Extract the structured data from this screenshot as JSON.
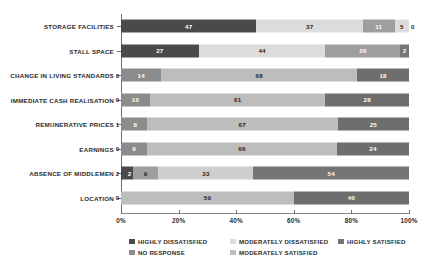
{
  "chart_data": {
    "type": "bar",
    "orientation": "horizontal",
    "stacked": true,
    "normalized_percent": true,
    "title": "",
    "xlabel": "",
    "ylabel": "",
    "xlim": [
      0,
      100
    ],
    "grid": false,
    "legend_position": "bottom",
    "xticks": [
      "0%",
      "20%",
      "40%",
      "60%",
      "80%",
      "100%"
    ],
    "xtick_values": [
      0,
      20,
      40,
      60,
      80,
      100
    ],
    "categories": [
      "STORAGE FACILITIES",
      "STALL SPACE",
      "CHANGE IN LIVING STANDARDS",
      "IMMEDIATE CASH REALISATION",
      "REMUNERATIVE PRICES",
      "EARNINGS",
      "ABSENCE OF MIDDLEMEN",
      "LOCATION"
    ],
    "series": [
      {
        "name": "NO RESPONSE",
        "color": "#8c8c8c",
        "values": [
          null,
          null,
          0,
          0,
          1,
          0,
          2,
          0
        ]
      },
      {
        "name": "HIGHLY DISSATISFIED",
        "color": "#4a4a4a",
        "values": [
          47,
          27,
          14,
          10,
          8,
          9,
          2,
          null
        ]
      },
      {
        "name": "MODERATELY DISSATISFIED",
        "color": "#dcdcdc",
        "values": [
          37,
          44,
          null,
          null,
          null,
          null,
          9,
          null
        ]
      },
      {
        "name": "MODERATELY SATISFIED",
        "color": "#b4b4b4",
        "values": [
          11,
          26,
          68,
          61,
          67,
          66,
          33,
          59
        ]
      },
      {
        "name": "HIGHLY SATISFIED",
        "color": "#757575",
        "values": [
          5,
          2,
          18,
          28,
          25,
          24,
          54,
          40
        ]
      }
    ],
    "bars": [
      {
        "category": "STORAGE FACILITIES",
        "segments": [
          {
            "series": "HIGHLY DISSATISFIED",
            "value": 47,
            "label": "47",
            "color": "#4a4a4a",
            "label_color": "light",
            "label_placement": "inside"
          },
          {
            "series": "MODERATELY DISSATISFIED",
            "value": 37,
            "label": "37",
            "color": "#dcdcdc",
            "label_color": "dark",
            "label_placement": "inside"
          },
          {
            "series": "MODERATELY SATISFIED",
            "value": 11,
            "label": "11",
            "color": "#9e9e9e",
            "label_color": "light",
            "label_placement": "inside"
          },
          {
            "series": "HIGHLY SATISFIED",
            "value": 5,
            "label": "5",
            "color": "#dcdcdc",
            "label_color": "dark",
            "label_placement": "inside"
          },
          {
            "series": "EXTRA",
            "value": 0,
            "label": "0",
            "color": "#dcdcdc",
            "label_color": "dark",
            "label_placement": "outside-right"
          }
        ]
      },
      {
        "category": "STALL SPACE",
        "segments": [
          {
            "series": "HIGHLY DISSATISFIED",
            "value": 27,
            "label": "27",
            "color": "#4a4a4a",
            "label_color": "light",
            "label_placement": "inside"
          },
          {
            "series": "MODERATELY DISSATISFIED",
            "value": 44,
            "label": "44",
            "color": "#dcdcdc",
            "label_color": "dark",
            "label_placement": "inside"
          },
          {
            "series": "MODERATELY SATISFIED",
            "value": 26,
            "label": "26",
            "color": "#9e9e9e",
            "label_color": "light",
            "label_placement": "inside"
          },
          {
            "series": "HIGHLY SATISFIED",
            "value": 3,
            "label": "2",
            "color": "#757575",
            "label_color": "light",
            "label_placement": "inside"
          }
        ]
      },
      {
        "category": "CHANGE IN LIVING STANDARDS",
        "segments": [
          {
            "series": "NO RESPONSE",
            "value": 0,
            "label": "0",
            "color": "#8c8c8c",
            "label_color": "dark",
            "label_placement": "outside-left"
          },
          {
            "series": "HIGHLY DISSATISFIED",
            "value": 14,
            "label": "14",
            "color": "#8c8c8c",
            "label_color": "light",
            "label_placement": "inside"
          },
          {
            "series": "MODERATELY SATISFIED",
            "value": 68,
            "label": "68",
            "color": "#bdbdbd",
            "label_color": "dark",
            "label_placement": "inside"
          },
          {
            "series": "HIGHLY SATISFIED",
            "value": 18,
            "label": "18",
            "color": "#6e6e6e",
            "label_color": "light",
            "label_placement": "inside"
          }
        ]
      },
      {
        "category": "IMMEDIATE CASH REALISATION",
        "segments": [
          {
            "series": "NO RESPONSE",
            "value": 0,
            "label": "0",
            "color": "#8c8c8c",
            "label_color": "dark",
            "label_placement": "outside-left"
          },
          {
            "series": "HIGHLY DISSATISFIED",
            "value": 10,
            "label": "10",
            "color": "#8c8c8c",
            "label_color": "light",
            "label_placement": "inside"
          },
          {
            "series": "MODERATELY SATISFIED",
            "value": 61,
            "label": "61",
            "color": "#bdbdbd",
            "label_color": "dark",
            "label_placement": "inside"
          },
          {
            "series": "HIGHLY SATISFIED",
            "value": 29,
            "label": "28",
            "color": "#6e6e6e",
            "label_color": "light",
            "label_placement": "inside"
          }
        ]
      },
      {
        "category": "REMUNERATIVE PRICES",
        "segments": [
          {
            "series": "NO RESPONSE",
            "value": 1,
            "label": "1",
            "color": "#8c8c8c",
            "label_color": "dark",
            "label_placement": "outside-left"
          },
          {
            "series": "HIGHLY DISSATISFIED",
            "value": 8,
            "label": "8",
            "color": "#8c8c8c",
            "label_color": "light",
            "label_placement": "inside"
          },
          {
            "series": "MODERATELY SATISFIED",
            "value": 67,
            "label": "67",
            "color": "#bdbdbd",
            "label_color": "dark",
            "label_placement": "inside"
          },
          {
            "series": "HIGHLY SATISFIED",
            "value": 25,
            "label": "25",
            "color": "#6e6e6e",
            "label_color": "light",
            "label_placement": "inside"
          }
        ]
      },
      {
        "category": "EARNINGS",
        "segments": [
          {
            "series": "NO RESPONSE",
            "value": 0,
            "label": "0",
            "color": "#8c8c8c",
            "label_color": "dark",
            "label_placement": "outside-left"
          },
          {
            "series": "HIGHLY DISSATISFIED",
            "value": 9,
            "label": "9",
            "color": "#8c8c8c",
            "label_color": "light",
            "label_placement": "inside"
          },
          {
            "series": "MODERATELY SATISFIED",
            "value": 66,
            "label": "66",
            "color": "#bdbdbd",
            "label_color": "dark",
            "label_placement": "inside"
          },
          {
            "series": "HIGHLY SATISFIED",
            "value": 25,
            "label": "24",
            "color": "#6e6e6e",
            "label_color": "light",
            "label_placement": "inside"
          }
        ]
      },
      {
        "category": "ABSENCE OF MIDDLEMEN",
        "segments": [
          {
            "series": "NO RESPONSE",
            "value": 2,
            "label": "2",
            "color": "#4a4a4a",
            "label_color": "dark",
            "label_placement": "outside-left"
          },
          {
            "series": "HIGHLY DISSATISFIED",
            "value": 2,
            "label": "2",
            "color": "#4a4a4a",
            "label_color": "light",
            "label_placement": "inside"
          },
          {
            "series": "MODERATELY DISSATISFIED",
            "value": 9,
            "label": "9",
            "color": "#9e9e9e",
            "label_color": "dark",
            "label_placement": "inside"
          },
          {
            "series": "MODERATELY SATISFIED",
            "value": 33,
            "label": "33",
            "color": "#cfcfcf",
            "label_color": "dark",
            "label_placement": "inside"
          },
          {
            "series": "HIGHLY SATISFIED",
            "value": 54,
            "label": "54",
            "color": "#757575",
            "label_color": "light",
            "label_placement": "inside"
          }
        ]
      },
      {
        "category": "LOCATION",
        "segments": [
          {
            "series": "NO RESPONSE",
            "value": 0,
            "label": "0",
            "color": "#8c8c8c",
            "label_color": "dark",
            "label_placement": "outside-left"
          },
          {
            "series": "MODERATELY SATISFIED",
            "value": 60,
            "label": "59",
            "color": "#bdbdbd",
            "label_color": "dark",
            "label_placement": "inside"
          },
          {
            "series": "HIGHLY SATISFIED",
            "value": 40,
            "label": "40",
            "color": "#6e6e6e",
            "label_color": "light",
            "label_placement": "inside"
          }
        ]
      }
    ],
    "legend": [
      {
        "label": "HIGHLY DISSATISFIED",
        "color": "#4a4a4a"
      },
      {
        "label": "MODERATELY DISSATISFIED",
        "color": "#dcdcdc"
      },
      {
        "label": "HIGHLY SATISFIED",
        "color": "#757575"
      },
      {
        "label": "NO RESPONSE",
        "color": "#8c8c8c"
      },
      {
        "label": "MODERATELY SATISFIED",
        "color": "#bdbdbd"
      }
    ]
  }
}
